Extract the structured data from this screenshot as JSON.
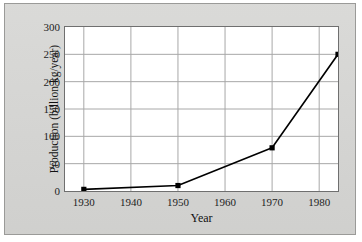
{
  "chart_data": {
    "type": "line",
    "title": "",
    "xlabel": "Year",
    "ylabel": "Production (billion kg/year)",
    "xlim": [
      1926,
      1984
    ],
    "ylim": [
      0,
      300
    ],
    "xticks": [
      1930,
      1940,
      1950,
      1960,
      1970,
      1980
    ],
    "yticks": [
      0,
      50,
      100,
      150,
      200,
      250,
      300
    ],
    "grid": true,
    "legend": null,
    "series": [
      {
        "name": "Production",
        "marker": "square",
        "color": "#000000",
        "x": [
          1930,
          1950,
          1970,
          1984
        ],
        "y": [
          3,
          10,
          79,
          250
        ]
      }
    ]
  },
  "axes": {
    "y_title": "Production (billion kg/year)",
    "x_title": "Year",
    "y_tick_labels": [
      "300",
      "250",
      "200",
      "150",
      "100",
      "50",
      "0"
    ],
    "x_tick_labels": [
      "1930",
      "1940",
      "1950",
      "1960",
      "1970",
      "1980"
    ]
  },
  "colors": {
    "panel_background": "#d6d6d4",
    "plot_background": "#ffffff",
    "grid": "#a8a8a8",
    "axis": "#6f6f6f",
    "data": "#000000",
    "text": "#1d1d1d"
  }
}
